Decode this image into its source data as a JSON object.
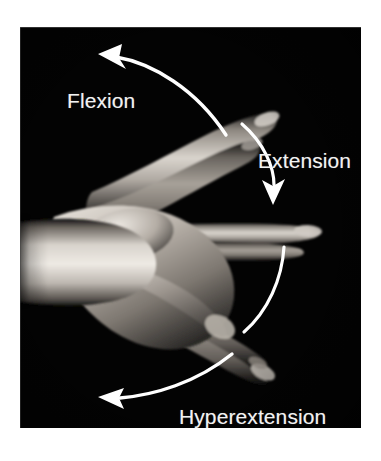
{
  "figure": {
    "panel": {
      "background_color": "#030303",
      "left": 20,
      "top": 27,
      "width": 341,
      "height": 401
    },
    "page_background_color": "#ffffff"
  },
  "subject": {
    "name": "hand-photograph",
    "description": "Grayscale photograph of a right hand and forearm entering from the left, shown in three superimposed wrist positions",
    "color_mode": "grayscale",
    "skin_highlight_color": "#e8e4de",
    "skin_midtone_color": "#9a948d",
    "skin_shadow_color": "#2e2c2a"
  },
  "annotations": {
    "arrow_color": "#ffffff",
    "items": [
      {
        "id": "flexion",
        "label": "Flexion",
        "icon": "curved-arrow-left-icon",
        "direction": "up-left",
        "label_position": {
          "x": 47,
          "y": 62
        },
        "font_size_px": 21
      },
      {
        "id": "extension",
        "label": "Extension",
        "icon": "curved-arrow-down-icon",
        "direction": "down",
        "label_position": {
          "x": 238,
          "y": 122
        },
        "font_size_px": 21
      },
      {
        "id": "hyperextension",
        "label": "Hyperextension",
        "icon": "curved-arrow-left-icon",
        "direction": "down-left",
        "label_position": {
          "x": 159,
          "y": 378
        },
        "font_size_px": 21
      }
    ],
    "arc": {
      "id": "range-of-motion-arc",
      "description": "White arc segments tracing the path of the fingertips through the wrist range of motion",
      "stroke_color": "#ffffff",
      "stroke_width_px": 3
    }
  }
}
